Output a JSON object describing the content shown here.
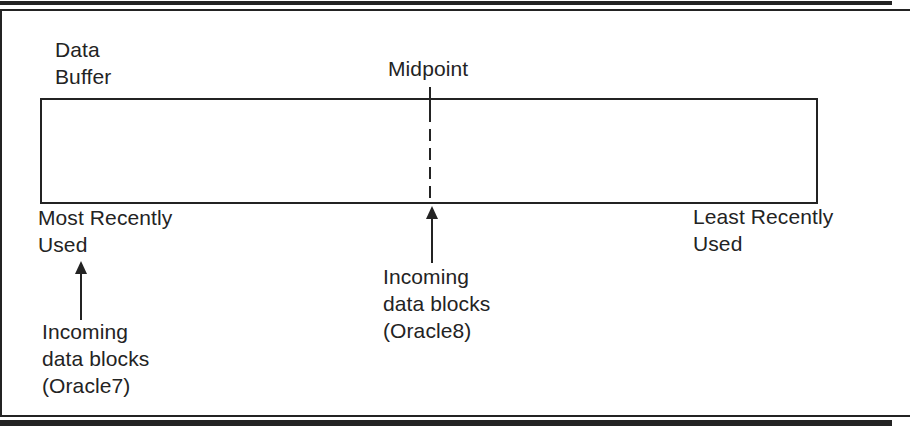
{
  "colors": {
    "ink": "#232323",
    "background": "#ffffff"
  },
  "diagram": {
    "buffer_title": {
      "line1": "Data",
      "line2": "Buffer"
    },
    "midpoint_label": "Midpoint",
    "mru_label": {
      "line1": "Most Recently",
      "line2": "Used"
    },
    "lru_label": {
      "line1": "Least Recently",
      "line2": "Used"
    },
    "incoming_oracle7": {
      "line1": "Incoming",
      "line2": "data blocks",
      "line3": "(Oracle7)"
    },
    "incoming_oracle8": {
      "line1": "Incoming",
      "line2": "data blocks",
      "line3": "(Oracle8)"
    }
  }
}
